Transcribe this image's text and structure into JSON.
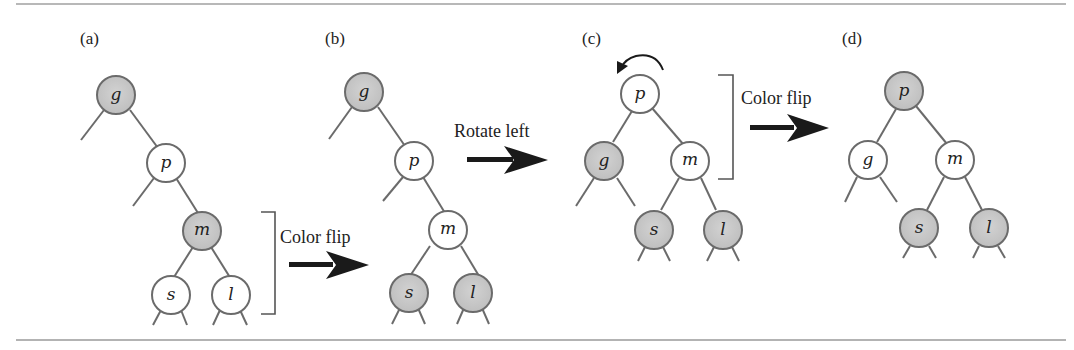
{
  "figure": {
    "colors": {
      "red_node_fill": "#c8c8c8",
      "black_node_fill": "#ffffff",
      "node_stroke": "#6b6b6b",
      "edge": "#6b6b6b",
      "arrow": "#1a1a1a",
      "rule": "#9a9a9a",
      "bracket": "#555555"
    },
    "legend_semantics": {
      "gray_node": "red link / red node",
      "white_node": "black node"
    },
    "panels": [
      {
        "id": "a",
        "label": "(a)",
        "nodes": [
          {
            "key": "g",
            "color": "red"
          },
          {
            "key": "p",
            "color": "black"
          },
          {
            "key": "m",
            "color": "red"
          },
          {
            "key": "s",
            "color": "black"
          },
          {
            "key": "l",
            "color": "black"
          }
        ],
        "edges": [
          [
            "g",
            "p"
          ],
          [
            "p",
            "m"
          ],
          [
            "m",
            "s"
          ],
          [
            "m",
            "l"
          ]
        ]
      },
      {
        "id": "b",
        "label": "(b)",
        "nodes": [
          {
            "key": "g",
            "color": "red"
          },
          {
            "key": "p",
            "color": "black"
          },
          {
            "key": "m",
            "color": "black"
          },
          {
            "key": "s",
            "color": "red"
          },
          {
            "key": "l",
            "color": "red"
          }
        ],
        "edges": [
          [
            "g",
            "p"
          ],
          [
            "p",
            "m"
          ],
          [
            "m",
            "s"
          ],
          [
            "m",
            "l"
          ]
        ]
      },
      {
        "id": "c",
        "label": "(c)",
        "nodes": [
          {
            "key": "p",
            "color": "black"
          },
          {
            "key": "g",
            "color": "red"
          },
          {
            "key": "m",
            "color": "black"
          },
          {
            "key": "s",
            "color": "red"
          },
          {
            "key": "l",
            "color": "red"
          }
        ],
        "edges": [
          [
            "p",
            "g"
          ],
          [
            "p",
            "m"
          ],
          [
            "m",
            "s"
          ],
          [
            "m",
            "l"
          ]
        ],
        "annotation": "rotation-arrow"
      },
      {
        "id": "d",
        "label": "(d)",
        "nodes": [
          {
            "key": "p",
            "color": "red"
          },
          {
            "key": "g",
            "color": "black"
          },
          {
            "key": "m",
            "color": "black"
          },
          {
            "key": "s",
            "color": "red"
          },
          {
            "key": "l",
            "color": "red"
          }
        ],
        "edges": [
          [
            "p",
            "g"
          ],
          [
            "p",
            "m"
          ],
          [
            "m",
            "s"
          ],
          [
            "m",
            "l"
          ]
        ]
      }
    ],
    "operations": [
      {
        "from": "a",
        "to": "b",
        "label": "Color flip"
      },
      {
        "from": "b",
        "to": "c",
        "label": "Rotate left"
      },
      {
        "from": "c",
        "to": "d",
        "label": "Color flip"
      }
    ]
  }
}
